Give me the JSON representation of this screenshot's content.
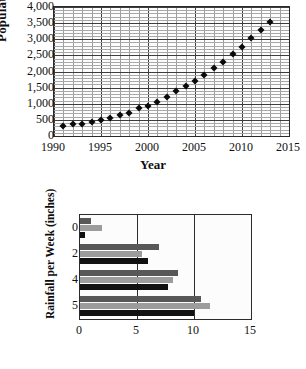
{
  "chart_data": [
    {
      "type": "scatter",
      "title": "",
      "xlabel": "Year",
      "ylabel": "Population",
      "xlim": [
        1990,
        2015
      ],
      "ylim": [
        0,
        4000
      ],
      "xticks": [
        1990,
        1995,
        2000,
        2005,
        2010,
        2015
      ],
      "xtick_labels": [
        "1990",
        "1995",
        "2000",
        "2005",
        "2010",
        "2015"
      ],
      "yticks": [
        0,
        500,
        1000,
        1500,
        2000,
        2500,
        3000,
        3500,
        4000
      ],
      "ytick_labels": [
        "0",
        "500",
        "1,000",
        "1,500",
        "2,000",
        "2,500",
        "3,000",
        "3,500",
        "4,000"
      ],
      "grid": "minor-and-major",
      "minor_x_step": 1,
      "minor_y_step": 100,
      "legend": "none",
      "marker": "diamond",
      "marker_color": "#0a0a0a",
      "x": [
        1991,
        1992,
        1993,
        1994,
        1995,
        1996,
        1997,
        1998,
        1999,
        2000,
        2001,
        2002,
        2003,
        2004,
        2005,
        2006,
        2007,
        2008,
        2009,
        2010,
        2011,
        2012,
        2013
      ],
      "y": [
        320,
        360,
        375,
        420,
        490,
        555,
        665,
        725,
        855,
        930,
        1050,
        1205,
        1400,
        1545,
        1710,
        1880,
        2120,
        2300,
        2530,
        2770,
        3040,
        3280,
        3550
      ]
    },
    {
      "type": "bar",
      "orientation": "horizontal",
      "title": "",
      "xlabel": "",
      "ylabel": "Rainfall per Week (inches)",
      "xlim": [
        0,
        15
      ],
      "xticks": [
        0,
        5,
        10,
        15
      ],
      "xtick_labels": [
        "0",
        "5",
        "10",
        "15"
      ],
      "ytick_labels": [
        "0",
        "2",
        "4",
        "5"
      ],
      "grid": "vertical-major",
      "legend": "none",
      "categories": [
        "0",
        "2",
        "4",
        "5"
      ],
      "series": [
        {
          "name": "series-1",
          "color": "#585858",
          "values": [
            1.0,
            6.9,
            8.6,
            10.6
          ]
        },
        {
          "name": "series-2",
          "color": "#9c9c9c",
          "values": [
            1.9,
            5.4,
            8.2,
            11.4
          ]
        },
        {
          "name": "series-3",
          "color": "#111111",
          "values": [
            0.45,
            5.95,
            7.7,
            10.0
          ]
        }
      ]
    }
  ],
  "scatter": {
    "ylabel": "Population",
    "xlabel": "Year"
  },
  "bar": {
    "ylabel": "Rainfall per Week (inches)"
  }
}
